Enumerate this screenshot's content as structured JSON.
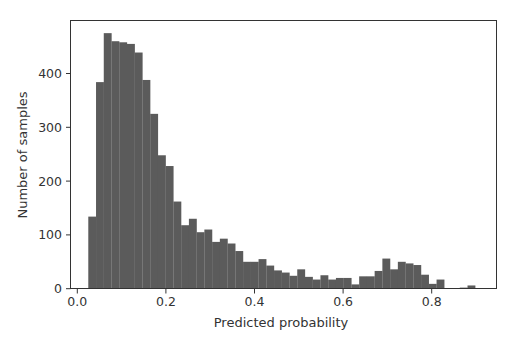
{
  "chart_data": {
    "type": "bar",
    "subtype": "histogram",
    "title": "",
    "xlabel": "Predicted probability",
    "ylabel": "Number of samples",
    "xlim": [
      -0.017,
      0.946
    ],
    "ylim": [
      0,
      498
    ],
    "xticks": [
      0.0,
      0.2,
      0.4,
      0.6,
      0.8
    ],
    "xtick_labels": [
      "0.0",
      "0.2",
      "0.4",
      "0.6",
      "0.8"
    ],
    "yticks": [
      0,
      100,
      200,
      300,
      400
    ],
    "ytick_labels": [
      "0",
      "100",
      "200",
      "300",
      "400"
    ],
    "grid": false,
    "legend": null,
    "bar_color": "#5b5b5b",
    "bin_start": 0.0248,
    "bin_width": 0.01747,
    "num_bins": 50,
    "values": [
      134,
      384,
      475,
      460,
      458,
      455,
      439,
      388,
      325,
      248,
      228,
      162,
      118,
      130,
      105,
      110,
      87,
      93,
      84,
      70,
      50,
      50,
      55,
      43,
      34,
      30,
      24,
      36,
      22,
      17,
      25,
      17,
      20,
      20,
      8,
      23,
      23,
      33,
      56,
      36,
      50,
      47,
      44,
      26,
      9,
      17,
      1,
      1,
      2,
      6
    ]
  }
}
